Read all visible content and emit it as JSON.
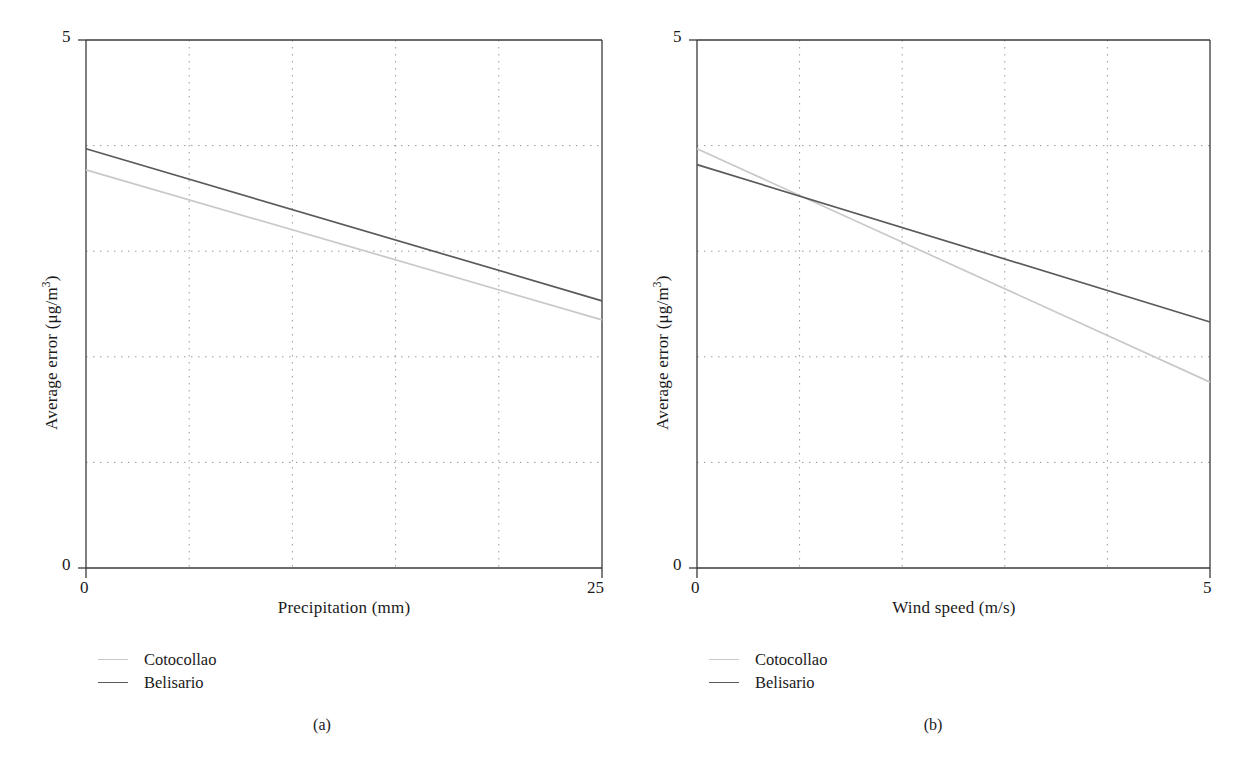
{
  "figure": {
    "background": "#ffffff",
    "series_colors": {
      "cotocollao": "#c9c9c9",
      "belisario": "#5a5a5a"
    },
    "axis_color": "#3a3a3a",
    "grid_color": "#9a9a9a"
  },
  "panels": [
    {
      "id": "a",
      "caption": "(a)",
      "legend": [
        {
          "label": "Cotocollao",
          "color": "#c9c9c9"
        },
        {
          "label": "Belisario",
          "color": "#5a5a5a"
        }
      ]
    },
    {
      "id": "b",
      "caption": "(b)",
      "legend": [
        {
          "label": "Cotocollao",
          "color": "#c9c9c9"
        },
        {
          "label": "Belisario",
          "color": "#5a5a5a"
        }
      ]
    }
  ],
  "labels": {
    "y_top_a": "5",
    "y_bottom_a": "0",
    "x_left_a": "0",
    "x_right_a": "25",
    "y_top_b": "5",
    "y_bottom_b": "0",
    "x_left_b": "0",
    "x_right_b": "5",
    "y_title_prefix": "Average error (μg/m",
    "y_title_sup": "3",
    "y_title_suffix": ")",
    "x_title_a": "Precipitation (mm)",
    "x_title_b": "Wind speed (m/s)"
  },
  "chart_data": [
    {
      "type": "line",
      "panel": "a",
      "title": "",
      "xlabel": "Precipitation (mm)",
      "ylabel": "Average error (μg/m³)",
      "xlim": [
        0,
        25
      ],
      "ylim": [
        0,
        5
      ],
      "xticks": [
        0,
        25
      ],
      "yticks": [
        0,
        5
      ],
      "grid": true,
      "grid_x": [
        5,
        10,
        15,
        20
      ],
      "grid_y": [
        1,
        2,
        3,
        4
      ],
      "legend_position": "below-left",
      "series": [
        {
          "name": "Cotocollao",
          "color": "#c9c9c9",
          "x": [
            0,
            25
          ],
          "values": [
            3.77,
            2.35
          ]
        },
        {
          "name": "Belisario",
          "color": "#5a5a5a",
          "x": [
            0,
            25
          ],
          "values": [
            3.97,
            2.53
          ]
        }
      ]
    },
    {
      "type": "line",
      "panel": "b",
      "title": "",
      "xlabel": "Wind speed (m/s)",
      "ylabel": "Average error (μg/m³)",
      "xlim": [
        0,
        5
      ],
      "ylim": [
        0,
        5
      ],
      "xticks": [
        0,
        5
      ],
      "yticks": [
        0,
        5
      ],
      "grid": true,
      "grid_x": [
        1,
        2,
        3,
        4
      ],
      "grid_y": [
        1,
        2,
        3,
        4
      ],
      "legend_position": "below-left",
      "series": [
        {
          "name": "Cotocollao",
          "color": "#c9c9c9",
          "x": [
            0,
            5
          ],
          "values": [
            3.97,
            1.76
          ]
        },
        {
          "name": "Belisario",
          "color": "#5a5a5a",
          "x": [
            0,
            5
          ],
          "values": [
            3.82,
            2.33
          ]
        }
      ]
    }
  ]
}
